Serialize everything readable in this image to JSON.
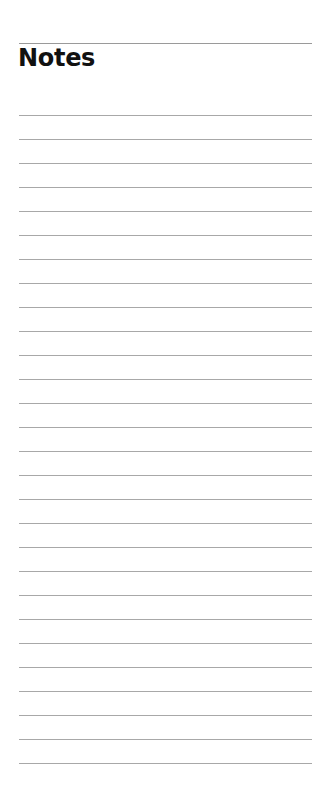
{
  "page": {
    "title": "Notes",
    "line_count": 28,
    "line_spacing_px": 24,
    "line_color": "#a8a8a8",
    "rule_color": "#9a9a9a",
    "text_color": "#111111",
    "background": "#ffffff"
  }
}
